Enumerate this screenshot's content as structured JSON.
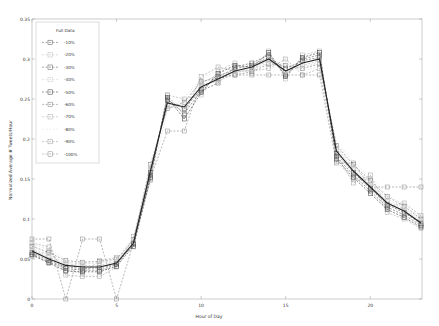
{
  "chart_data": {
    "type": "line",
    "title": "",
    "xlabel": "Hour of Day",
    "ylabel": "Normalized Average # Tweets/Hour",
    "xlim": [
      0,
      23
    ],
    "ylim": [
      0,
      0.35
    ],
    "xticks": [
      0,
      5,
      10,
      15,
      20
    ],
    "yticks": [
      0,
      0.05,
      0.1,
      0.15,
      0.2,
      0.25,
      0.3,
      0.35
    ],
    "ytick_labels": [
      "0",
      "0.05",
      "0.1",
      "0.15",
      "0.2",
      "0.25",
      "0.3",
      "0.35"
    ],
    "grid": false,
    "legend_position": "upper left",
    "x": [
      0,
      1,
      2,
      3,
      4,
      5,
      6,
      7,
      8,
      9,
      10,
      11,
      12,
      13,
      14,
      15,
      16,
      17,
      18,
      19,
      20,
      21,
      22,
      23
    ],
    "series": [
      {
        "name": "Full Data",
        "style": "solid",
        "color": "#222222",
        "marker": "none",
        "values": [
          0.06,
          0.05,
          0.042,
          0.04,
          0.04,
          0.045,
          0.07,
          0.16,
          0.245,
          0.24,
          0.265,
          0.275,
          0.285,
          0.29,
          0.3,
          0.285,
          0.295,
          0.3,
          0.185,
          0.16,
          0.14,
          0.12,
          0.11,
          0.095
        ]
      },
      {
        "name": "-10%",
        "style": "dashed",
        "color": "#555555",
        "marker": "square",
        "values": [
          0.058,
          0.048,
          0.04,
          0.038,
          0.039,
          0.044,
          0.069,
          0.158,
          0.248,
          0.238,
          0.262,
          0.278,
          0.288,
          0.292,
          0.302,
          0.288,
          0.298,
          0.302,
          0.182,
          0.158,
          0.138,
          0.118,
          0.108,
          0.094
        ]
      },
      {
        "name": "-20%",
        "style": "dashed",
        "color": "#bbbbbb",
        "marker": "square",
        "values": [
          0.062,
          0.052,
          0.044,
          0.042,
          0.042,
          0.047,
          0.071,
          0.162,
          0.242,
          0.236,
          0.268,
          0.272,
          0.282,
          0.288,
          0.298,
          0.283,
          0.292,
          0.298,
          0.188,
          0.162,
          0.142,
          0.122,
          0.112,
          0.096
        ]
      },
      {
        "name": "-30%",
        "style": "dashed",
        "color": "#555555",
        "marker": "square",
        "values": [
          0.056,
          0.046,
          0.038,
          0.036,
          0.036,
          0.043,
          0.068,
          0.155,
          0.25,
          0.232,
          0.26,
          0.27,
          0.29,
          0.295,
          0.305,
          0.28,
          0.3,
          0.305,
          0.178,
          0.155,
          0.135,
          0.115,
          0.105,
          0.092
        ]
      },
      {
        "name": "-40%",
        "style": "dashed",
        "color": "#cccccc",
        "marker": "square",
        "values": [
          0.064,
          0.054,
          0.046,
          0.044,
          0.045,
          0.049,
          0.073,
          0.165,
          0.24,
          0.244,
          0.27,
          0.28,
          0.284,
          0.286,
          0.296,
          0.29,
          0.29,
          0.296,
          0.19,
          0.165,
          0.145,
          0.125,
          0.114,
          0.098
        ]
      },
      {
        "name": "-50%",
        "style": "dashed",
        "color": "#333333",
        "marker": "square",
        "values": [
          0.055,
          0.045,
          0.035,
          0.034,
          0.034,
          0.041,
          0.066,
          0.152,
          0.252,
          0.225,
          0.258,
          0.282,
          0.292,
          0.29,
          0.308,
          0.278,
          0.302,
          0.308,
          0.175,
          0.152,
          0.132,
          0.112,
          0.102,
          0.09
        ]
      },
      {
        "name": "-60%",
        "style": "dashed",
        "color": "#777777",
        "marker": "square",
        "values": [
          0.066,
          0.058,
          0.048,
          0.046,
          0.047,
          0.05,
          0.074,
          0.168,
          0.238,
          0.246,
          0.272,
          0.276,
          0.28,
          0.284,
          0.294,
          0.292,
          0.288,
          0.294,
          0.192,
          0.168,
          0.148,
          0.128,
          0.116,
          0.1
        ]
      },
      {
        "name": "-70%",
        "style": "dashed",
        "color": "#aaaaaa",
        "marker": "square",
        "values": [
          0.053,
          0.06,
          0.036,
          0.032,
          0.048,
          0.052,
          0.065,
          0.15,
          0.255,
          0.25,
          0.255,
          0.285,
          0.295,
          0.282,
          0.31,
          0.275,
          0.305,
          0.31,
          0.172,
          0.15,
          0.15,
          0.108,
          0.1,
          0.088
        ]
      },
      {
        "name": "-80%",
        "style": "dashed",
        "color": "#dddddd",
        "marker": "none",
        "values": [
          0.068,
          0.062,
          0.05,
          0.03,
          0.03,
          0.055,
          0.076,
          0.145,
          0.235,
          0.252,
          0.275,
          0.287,
          0.278,
          0.297,
          0.292,
          0.295,
          0.285,
          0.29,
          0.195,
          0.172,
          0.152,
          0.13,
          0.118,
          0.102
        ]
      },
      {
        "name": "-90%",
        "style": "dashed",
        "color": "#999999",
        "marker": "square",
        "values": [
          0.07,
          0.065,
          0.03,
          0.028,
          0.028,
          0.04,
          0.078,
          0.148,
          0.255,
          0.23,
          0.278,
          0.29,
          0.285,
          0.285,
          0.288,
          0.3,
          0.28,
          0.288,
          0.18,
          0.145,
          0.155,
          0.115,
          0.12,
          0.104
        ]
      },
      {
        "name": "-100%",
        "style": "dashed",
        "color": "#888888",
        "marker": "square",
        "values": [
          0.075,
          0.075,
          0.0,
          0.075,
          0.075,
          0.0,
          0.07,
          0.15,
          0.21,
          0.21,
          0.27,
          0.28,
          0.28,
          0.28,
          0.28,
          0.28,
          0.28,
          0.28,
          0.17,
          0.17,
          0.14,
          0.14,
          0.14,
          0.14
        ]
      }
    ]
  }
}
